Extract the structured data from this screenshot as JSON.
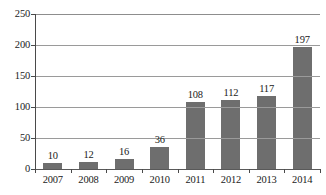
{
  "chart_data": {
    "type": "bar",
    "title": "",
    "subtitle": "",
    "xlabel": "",
    "ylabel": "",
    "categories": [
      "2007",
      "2008",
      "2009",
      "2010",
      "2011",
      "2012",
      "2013",
      "2014"
    ],
    "values": [
      10,
      12,
      16,
      36,
      108,
      112,
      117,
      197
    ],
    "value_labels": [
      "10",
      "12",
      "16",
      "36",
      "108",
      "112",
      "117",
      "197"
    ],
    "ylim": [
      0,
      250
    ],
    "y_ticks": [
      0,
      50,
      100,
      150,
      200,
      250
    ],
    "y_tick_labels": [
      "0",
      "50",
      "100",
      "150",
      "200",
      "250"
    ],
    "grid": true,
    "grid_axis": "y",
    "legend": false,
    "legend_position": "none",
    "series": [
      {
        "name": "",
        "values": [
          10,
          12,
          16,
          36,
          108,
          112,
          117,
          197
        ]
      }
    ],
    "colors": {
      "bar": "#6e6e6e",
      "gridline": "#9a9a9a",
      "axis": "#4a4a4a",
      "text": "#1a1a1a",
      "background": "#ffffff"
    }
  }
}
